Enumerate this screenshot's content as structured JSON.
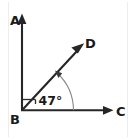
{
  "figure": {
    "type": "geometry-angle-diagram",
    "background_color": "#ffffff",
    "line_color": "#262626",
    "arc_color": "#8a8a8a",
    "text_color": "#1a1a1a",
    "vertex_labels": {
      "a": "A",
      "b": "B",
      "c": "C",
      "d": "D"
    },
    "angle_label": "47°",
    "angle_value": 47,
    "angle_unit": "degrees",
    "rays": [
      {
        "name": "BA",
        "from": "B",
        "to": "A",
        "direction": "up",
        "arrow": true
      },
      {
        "name": "BC",
        "from": "B",
        "to": "C",
        "direction": "right",
        "arrow": true
      },
      {
        "name": "BD",
        "from": "B",
        "to": "D",
        "direction": "up-right",
        "arrow": true
      }
    ],
    "markers": {
      "angle_arc": "arc from ray BD to ray BC",
      "corner_tick": "small tick mark near vertex between ray BA and ray BD"
    }
  }
}
